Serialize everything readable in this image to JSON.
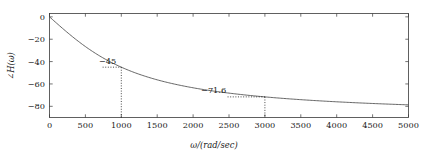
{
  "figure": {
    "name": "phase-response-plot",
    "background_color": "#ffffff",
    "frame_color": "#3a3a3a",
    "curve_color": "#4a4a4a"
  },
  "axes": {
    "x_title": "ω/(rad/sec)",
    "y_title": "∠H(ω)",
    "x_ticks": [
      0,
      500,
      1000,
      1500,
      2000,
      2500,
      3000,
      3500,
      4000,
      4500,
      5000
    ],
    "x_tick_labels": [
      "0",
      "500",
      "1000",
      "1500",
      "2000",
      "2500",
      "3000",
      "3500",
      "4000",
      "4500",
      "5000"
    ],
    "y_ticks": [
      0,
      -20,
      -40,
      -60,
      -80
    ],
    "y_tick_labels": [
      "0",
      "−20",
      "−40",
      "−60",
      "−80"
    ],
    "xlim": [
      0,
      5000
    ],
    "ylim": [
      -90,
      3
    ]
  },
  "annotations": [
    {
      "label": "−45",
      "omega": 1000,
      "phase": -45.0,
      "label_x": 930,
      "label_y": -42.5
    },
    {
      "label": "−71.6",
      "omega": 3000,
      "phase": -71.57,
      "label_x": 2460,
      "label_y": -68.0
    }
  ],
  "chart_data": {
    "type": "line",
    "title": "",
    "subtitle": "",
    "xlabel": "ω/(rad/sec)",
    "ylabel": "∠H(ω)",
    "xlim": [
      0,
      5000
    ],
    "ylim": [
      -90,
      3
    ],
    "grid": false,
    "legend": null,
    "x_ticks": [
      0,
      500,
      1000,
      1500,
      2000,
      2500,
      3000,
      3500,
      4000,
      4500,
      5000
    ],
    "y_ticks": [
      0,
      -20,
      -40,
      -60,
      -80
    ],
    "series": [
      {
        "name": "phase",
        "formula_degrees": "-atan(omega/1000)",
        "x": [
          0,
          100,
          200,
          300,
          400,
          500,
          600,
          700,
          800,
          900,
          1000,
          1200,
          1400,
          1600,
          1800,
          2000,
          2250,
          2500,
          2750,
          3000,
          3250,
          3500,
          3750,
          4000,
          4250,
          4500,
          4750,
          5000
        ],
        "values": [
          0.0,
          -5.7,
          -11.3,
          -16.7,
          -21.8,
          -26.6,
          -31.0,
          -35.0,
          -38.7,
          -42.0,
          -45.0,
          -50.2,
          -54.5,
          -58.0,
          -60.9,
          -63.4,
          -66.0,
          -68.2,
          -70.0,
          -71.6,
          -72.9,
          -74.1,
          -75.1,
          -76.0,
          -76.8,
          -77.5,
          -78.1,
          -78.7
        ]
      }
    ],
    "annotations": [
      {
        "text": "−45",
        "x": 1000,
        "y": -45.0
      },
      {
        "text": "−71.6",
        "x": 3000,
        "y": -71.57
      }
    ]
  }
}
